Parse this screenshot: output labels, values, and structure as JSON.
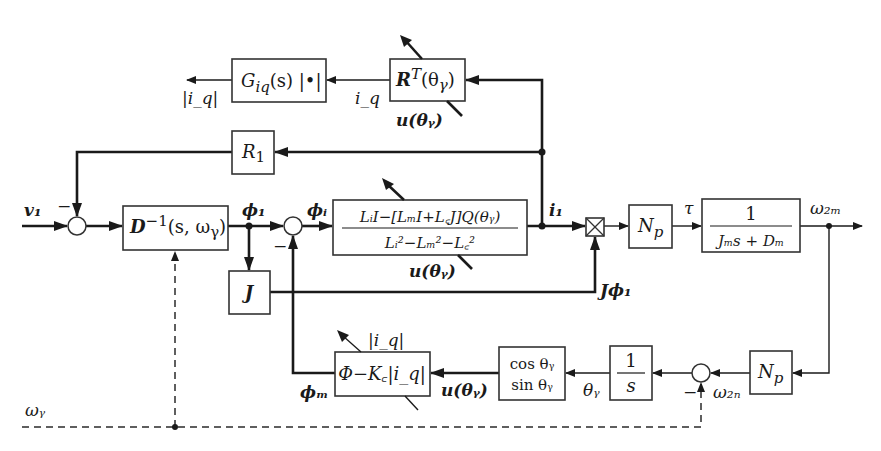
{
  "diagram": {
    "type": "control block diagram",
    "colors": {
      "line": "#1a1a1a",
      "block_border": "#333333",
      "background": "#ffffff"
    },
    "blocks": {
      "g_iq": {
        "label": "G_iq(s)|•|",
        "main": "G",
        "sub": "iq",
        "rest": "(s) |•|"
      },
      "rt": {
        "label": "R^T(θγ)",
        "main": "R",
        "sup": "T",
        "rest": "(θ",
        "sub": "γ",
        "close": ")"
      },
      "r1": {
        "label": "R1",
        "main": "R",
        "sub": "1"
      },
      "dinv": {
        "label": "D^-1(s, ωγ)",
        "main": "D",
        "sup": "−1",
        "rest": "(s, ω",
        "sub": "γ",
        "close": ")"
      },
      "plant": {
        "label": "(Li I − [Lm I + Lc J] Q(θγ)) / (Li² − Lm² − Lc²)",
        "numerator": "LᵢI−[LₘI+L꜀J]Q(θᵧ)",
        "denominator": "Lᵢ²−Lₘ²−L꜀²"
      },
      "j": {
        "label": "J"
      },
      "np_top": {
        "label": "Np",
        "main": "N",
        "sub": "p"
      },
      "mech": {
        "label": "1/(Jm s + Dm)",
        "numerator": "1",
        "denominator": "Jₘs + Dₘ"
      },
      "phi_kc": {
        "label": "Φ − Kc|iq|",
        "text": "Φ−K꜀|i_q|"
      },
      "trig": {
        "label": "cos θγ / sin θγ",
        "line1": "cos θᵧ",
        "line2": "sin θᵧ"
      },
      "integrator": {
        "label": "1/s",
        "numerator": "1",
        "denominator": "s"
      },
      "np_bottom": {
        "label": "Np",
        "main": "N",
        "sub": "p"
      }
    },
    "signals": {
      "v1": "v₁",
      "abs_iq_out": "|i_q|",
      "iq": "i_q",
      "u_theta_top": "u(θᵧ)",
      "phi1": "ϕ₁",
      "phii": "ϕᵢ",
      "i1": "i₁",
      "u_theta_mid": "u(θᵧ)",
      "j_phi1": "Jϕ₁",
      "tau": "τ",
      "omega2m": "ω₂ₘ",
      "abs_iq_param": "|i_q|",
      "phim": "ϕₘ",
      "u_theta_bottom": "u(θᵧ)",
      "theta_gamma": "θᵧ",
      "omega2n": "ω₂ₙ",
      "omega_gamma": "ωᵧ"
    },
    "signs": {
      "sum1_minus": "−",
      "sum2_minus": "−",
      "sum3_minus": "−"
    },
    "junction_symbol": "multiplier-cross"
  }
}
